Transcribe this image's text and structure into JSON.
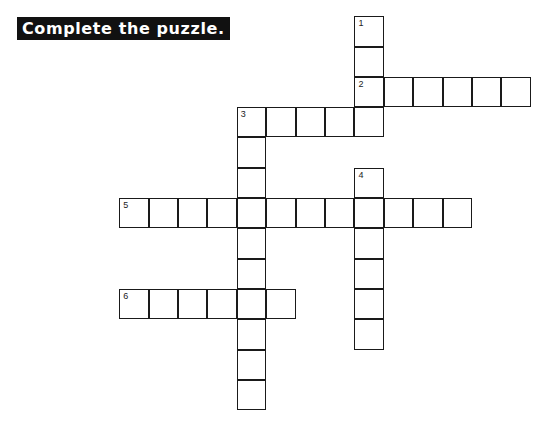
{
  "header": {
    "instruction": "Complete the puzzle."
  },
  "puzzle": {
    "grid_origin": {
      "x": 120,
      "y": 17
    },
    "cell_size": {
      "w": 29.4,
      "h": 30.3
    },
    "entries": [
      {
        "number": "1",
        "direction": "down",
        "row": 0,
        "col": 8,
        "length": 4
      },
      {
        "number": "2",
        "direction": "across",
        "row": 2,
        "col": 8,
        "length": 6
      },
      {
        "number": "3",
        "direction": "across",
        "row": 3,
        "col": 4,
        "length": 5
      },
      {
        "number": "3",
        "direction": "down",
        "row": 3,
        "col": 4,
        "length": 10
      },
      {
        "number": "4",
        "direction": "down",
        "row": 5,
        "col": 8,
        "length": 6
      },
      {
        "number": "5",
        "direction": "across",
        "row": 6,
        "col": 0,
        "length": 12
      },
      {
        "number": "6",
        "direction": "across",
        "row": 9,
        "col": 0,
        "length": 6
      }
    ]
  }
}
